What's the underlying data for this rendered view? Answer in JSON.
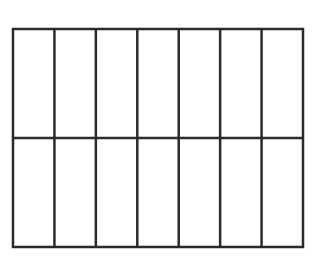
{
  "diagram": {
    "type": "partitioned-rectangle",
    "columns": 7,
    "rows": 2,
    "total_cells": 14,
    "shaded_cells": 0,
    "stroke_color": "#2b2b2b",
    "fill_color": "#ffffff",
    "background_color": "#ffffff",
    "bounds": {
      "x": 13,
      "y": 29,
      "width": 290,
      "height": 218
    },
    "stroke_width": 2.5
  }
}
